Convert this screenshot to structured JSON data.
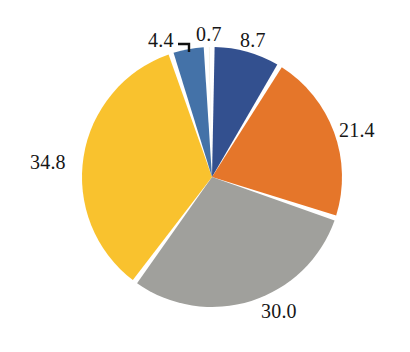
{
  "chart_data": {
    "type": "pie",
    "title": "",
    "subtitle": "",
    "xlabel": "",
    "ylabel": "",
    "legend_position": "none",
    "grid": false,
    "labels": [
      "8.7",
      "21.4",
      "30.0",
      "34.8",
      "4.4",
      "0.7"
    ],
    "values": [
      8.7,
      21.4,
      30.0,
      34.8,
      4.4,
      0.7
    ],
    "total": 100.0,
    "start_angle_deg": 0,
    "direction": "clockwise",
    "slice_gap": true,
    "colors": [
      "#33508f",
      "#e5762a",
      "#a0a09c",
      "#f9c22e",
      "#4472a8",
      "#e8e4d2"
    ],
    "slices": [
      {
        "label": "8.7",
        "value": 8.7,
        "color": "#33508f",
        "name": "slice-dark-blue"
      },
      {
        "label": "21.4",
        "value": 21.4,
        "color": "#e5762a",
        "name": "slice-orange"
      },
      {
        "label": "30.0",
        "value": 30.0,
        "color": "#a0a09c",
        "name": "slice-gray"
      },
      {
        "label": "34.8",
        "value": 34.8,
        "color": "#f9c22e",
        "name": "slice-yellow"
      },
      {
        "label": "4.4",
        "value": 4.4,
        "color": "#4472a8",
        "name": "slice-medium-blue"
      },
      {
        "label": "0.7",
        "value": 0.7,
        "color": "#e8e4d2",
        "name": "slice-sliver"
      }
    ],
    "geometry": {
      "center_x": 212,
      "center_y": 177,
      "radius": 130
    },
    "annotations": [
      {
        "label": "4.4",
        "leader_line": true,
        "points_to": "slice-medium-blue"
      }
    ]
  },
  "labels": {
    "v1": "8.7",
    "v2": "21.4",
    "v3": "30.0",
    "v4": "34.8",
    "v5": "4.4",
    "v6": "0.7"
  }
}
